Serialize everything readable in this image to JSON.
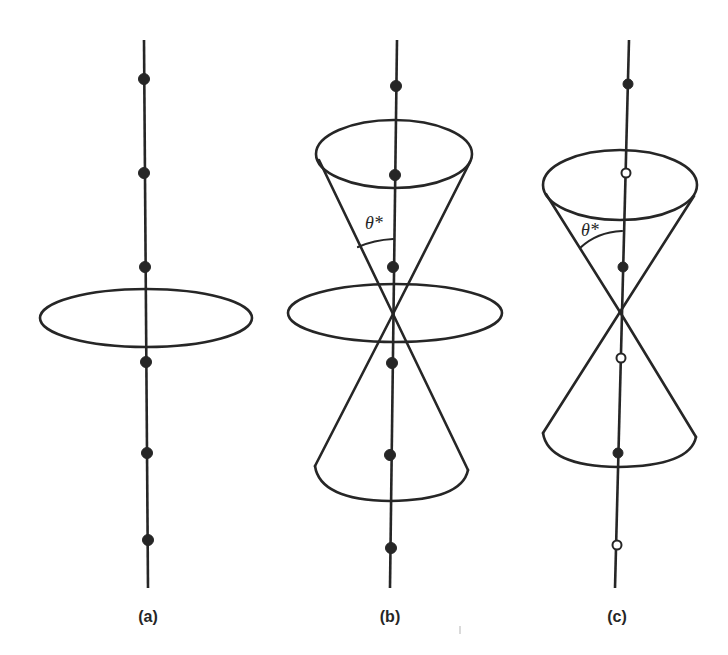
{
  "figure": {
    "background": "#ffffff",
    "ink_color": "#262626",
    "panels": [
      {
        "id": "a",
        "label": "(a)",
        "axis": {
          "x1": 144,
          "y1": 40,
          "x2": 148,
          "y2": 588
        },
        "disk": {
          "cx": 146,
          "cy": 318,
          "rx": 106,
          "ry": 29
        },
        "cones": [],
        "angle_label": null,
        "points": [
          {
            "x": 144,
            "y": 79,
            "type": "filled"
          },
          {
            "x": 144,
            "y": 173,
            "type": "filled"
          },
          {
            "x": 145,
            "y": 267,
            "type": "filled"
          },
          {
            "x": 146,
            "y": 362,
            "type": "filled"
          },
          {
            "x": 147,
            "y": 453,
            "type": "filled"
          },
          {
            "x": 148,
            "y": 540,
            "type": "filled"
          }
        ]
      },
      {
        "id": "b",
        "label": "(b)",
        "axis": {
          "x1": 397,
          "y1": 40,
          "x2": 390,
          "y2": 588
        },
        "disk": {
          "cx": 395,
          "cy": 313,
          "rx": 107,
          "ry": 29
        },
        "cones": [
          {
            "apex_x": 393,
            "apex_y": 314,
            "rim_cx": 394,
            "rim_cy": 154,
            "rim_rx": 78,
            "rim_ry": 34,
            "rim_left_y": 158,
            "direction": "up"
          },
          {
            "apex_x": 393,
            "apex_y": 314,
            "rim_cx": 391,
            "rim_cy": 460,
            "rim_rx": 77,
            "rim_ry": 36,
            "rim_left_y": 468,
            "direction": "down"
          }
        ],
        "angle_label": {
          "text": "θ*",
          "x": 367,
          "y": 228,
          "arc": "M 358 247 Q 374 240 393 239"
        },
        "points": [
          {
            "x": 396,
            "y": 86,
            "type": "filled"
          },
          {
            "x": 395,
            "y": 175,
            "type": "filled"
          },
          {
            "x": 393,
            "y": 267,
            "type": "filled"
          },
          {
            "x": 392,
            "y": 363,
            "type": "filled"
          },
          {
            "x": 390,
            "y": 455,
            "type": "filled"
          },
          {
            "x": 391,
            "y": 548,
            "type": "filled"
          }
        ]
      },
      {
        "id": "c",
        "label": "(c)",
        "axis": {
          "x1": 629,
          "y1": 40,
          "x2": 615,
          "y2": 588
        },
        "disk": null,
        "cones": [
          {
            "apex_x": 620,
            "apex_y": 312,
            "rim_cx": 620,
            "rim_cy": 185,
            "rim_rx": 77,
            "rim_ry": 35,
            "rim_left_y": 195,
            "direction": "up"
          },
          {
            "apex_x": 620,
            "apex_y": 312,
            "rim_cx": 618,
            "rim_cy": 430,
            "rim_rx": 77,
            "rim_ry": 36,
            "rim_left_y": 436,
            "direction": "down"
          }
        ],
        "angle_label": {
          "text": "θ*",
          "x": 582,
          "y": 236,
          "arc": "M 580 248 Q 597 232 622 231"
        },
        "points": [
          {
            "x": 628,
            "y": 84,
            "type": "filled"
          },
          {
            "x": 626,
            "y": 173,
            "type": "open"
          },
          {
            "x": 623,
            "y": 267,
            "type": "filled"
          },
          {
            "x": 621,
            "y": 358,
            "type": "open"
          },
          {
            "x": 618,
            "y": 453,
            "type": "filled"
          },
          {
            "x": 617,
            "y": 545,
            "type": "open"
          }
        ]
      }
    ],
    "labels": {
      "a": "(a)",
      "b": "(b)",
      "c": "(c)",
      "angle": "θ*"
    }
  }
}
